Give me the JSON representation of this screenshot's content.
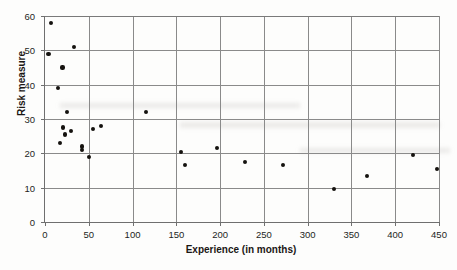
{
  "chart_data": {
    "type": "scatter",
    "title": "",
    "xlabel": "Experience (in months)",
    "ylabel": "Risk measure",
    "xlim": [
      0,
      450
    ],
    "ylim": [
      0,
      60
    ],
    "xticks": [
      0,
      50,
      100,
      150,
      200,
      250,
      300,
      350,
      400,
      450
    ],
    "yticks": [
      0,
      10,
      20,
      30,
      40,
      50,
      60
    ],
    "grid": "both",
    "legend": "none",
    "marker_color": "#15120f",
    "axis_color": "#6f6f6f",
    "grid_color": "#8a8a8a",
    "points": [
      {
        "x": 7,
        "y": 58.0
      },
      {
        "x": 4,
        "y": 49.0
      },
      {
        "x": 33,
        "y": 51.0
      },
      {
        "x": 20,
        "y": 45.0
      },
      {
        "x": 15,
        "y": 39.0
      },
      {
        "x": 25,
        "y": 32.0
      },
      {
        "x": 21,
        "y": 27.5
      },
      {
        "x": 23,
        "y": 25.5
      },
      {
        "x": 30,
        "y": 26.5
      },
      {
        "x": 17,
        "y": 23.0
      },
      {
        "x": 55,
        "y": 27.0
      },
      {
        "x": 64,
        "y": 28.0
      },
      {
        "x": 42,
        "y": 22.0
      },
      {
        "x": 42,
        "y": 21.0
      },
      {
        "x": 50,
        "y": 19.0
      },
      {
        "x": 115,
        "y": 32.0
      },
      {
        "x": 155,
        "y": 20.5
      },
      {
        "x": 160,
        "y": 16.5
      },
      {
        "x": 196,
        "y": 21.5
      },
      {
        "x": 228,
        "y": 17.5
      },
      {
        "x": 272,
        "y": 16.5
      },
      {
        "x": 330,
        "y": 9.5
      },
      {
        "x": 368,
        "y": 13.5
      },
      {
        "x": 420,
        "y": 19.5
      },
      {
        "x": 448,
        "y": 15.5
      }
    ]
  }
}
